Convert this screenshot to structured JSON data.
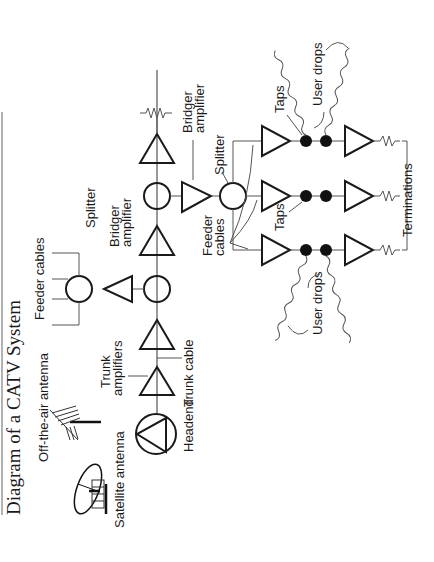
{
  "title": "Diagram of a CATV System",
  "labels": {
    "satellite_antenna": "Satellite antenna",
    "off_air_antenna": "Off-the-air antenna",
    "headend": "Headend",
    "trunk_amplifiers_1": "Trunk",
    "trunk_amplifiers_2": "amplifiers",
    "trunk_cable": "Trunk cable",
    "feeder_cables_top": "Feeder cables",
    "bridger_amp_1_a": "Bridger",
    "bridger_amp_1_b": "amplifier",
    "splitter_1": "Splitter",
    "bridger_amp_2_a": "Bridger",
    "bridger_amp_2_b": "amplifier",
    "splitter_2": "Splitter",
    "feeder_cables_a": "Feeder",
    "feeder_cables_b": "cables",
    "taps_top": "Taps",
    "taps_mid": "Taps",
    "user_drops_top": "User drops",
    "user_drops_bottom": "User drops",
    "terminations": "Terminations"
  },
  "colors": {
    "ink": "#1a1a1a",
    "background": "#ffffff",
    "border": "#888888"
  }
}
